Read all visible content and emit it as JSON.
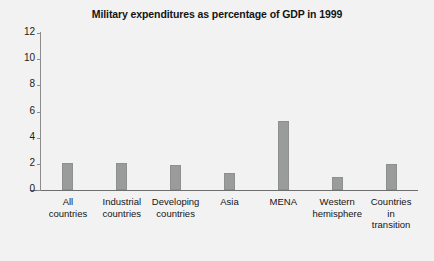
{
  "chart_data": {
    "type": "bar",
    "title": "Military expenditures as percentage of GDP in 1999",
    "xlabel": "",
    "ylabel": "",
    "ylim": [
      0,
      12
    ],
    "yticks": [
      0,
      2,
      4,
      6,
      8,
      10,
      12
    ],
    "grid": false,
    "legend": false,
    "categories": [
      "All countries",
      "Industrial countries",
      "Developing countries",
      "Asia",
      "MENA",
      "Western hemisphere",
      "Countries in transition"
    ],
    "category_lines": [
      [
        "All",
        "countries"
      ],
      [
        "Industrial",
        "countries"
      ],
      [
        "Developing",
        "countries"
      ],
      [
        "Asia"
      ],
      [
        "MENA"
      ],
      [
        "Western",
        "hemisphere"
      ],
      [
        "Countries",
        "in",
        "transition"
      ]
    ],
    "values": [
      2.1,
      2.1,
      1.9,
      1.3,
      5.3,
      1.0,
      2.0
    ],
    "bar_color": "#9a9b9b",
    "axis_color": "#6e6e6e",
    "background_color": "#f2f2f2"
  }
}
